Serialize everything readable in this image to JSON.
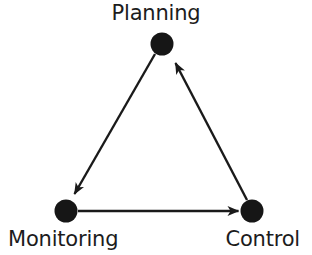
{
  "diagram": {
    "type": "cycle-triangle",
    "background_color": "#ffffff",
    "stroke_color": "#1a1a1a",
    "node_color": "#161616",
    "text_color": "#1c1c1c",
    "nodes": [
      {
        "id": "planning",
        "label": "Planning",
        "icon": "filled-circle-node",
        "x": 162,
        "y": 44,
        "radius": 11,
        "label_position": "above"
      },
      {
        "id": "monitoring",
        "label": "Monitoring",
        "icon": "filled-circle-node",
        "x": 66,
        "y": 211,
        "radius": 11,
        "label_position": "below"
      },
      {
        "id": "control",
        "label": "Control",
        "icon": "filled-circle-node",
        "x": 252,
        "y": 211,
        "radius": 11,
        "label_position": "below"
      }
    ],
    "edges": [
      {
        "id": "planning-to-monitoring",
        "from": "planning",
        "to": "monitoring",
        "arrowhead": "end",
        "direction": "down-left"
      },
      {
        "id": "monitoring-to-control",
        "from": "monitoring",
        "to": "control",
        "arrowhead": "end",
        "direction": "right"
      },
      {
        "id": "control-to-planning",
        "from": "control",
        "to": "planning",
        "arrowhead": "end",
        "direction": "up-left"
      }
    ]
  }
}
